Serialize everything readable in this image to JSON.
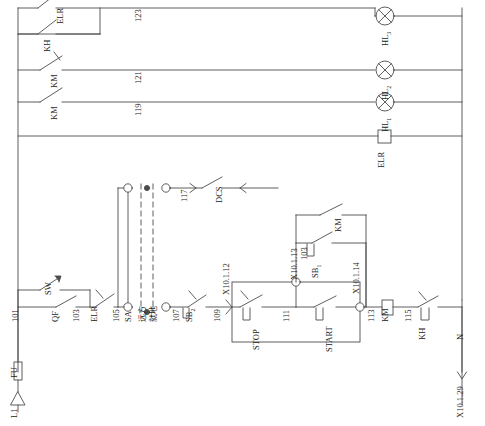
{
  "diagram": {
    "line_color": "#4d4d4d",
    "text_color": "#1a1a1a"
  },
  "supply": {
    "phase_label": "L1",
    "fuse_label": "FU",
    "wire_101": "101",
    "neutral_label": "N",
    "neutral_terminal": "X10.1.29"
  },
  "rungs": {
    "rail_123": "123",
    "rail_121": "121",
    "rail_119": "119",
    "rail_117": "117"
  },
  "lamps": [
    {
      "name": "HL",
      "sub": "3"
    },
    {
      "name": "HL",
      "sub": "2"
    },
    {
      "name": "HL",
      "sub": "1"
    }
  ],
  "devices": {
    "elr_contact_top": "ELR",
    "kh_contact_top": "KH",
    "km_nc_contact": "KM",
    "km_no_contact": "KM",
    "elr_relay": "ELR",
    "qf_contact": "QF",
    "sw_contact": "SW",
    "elr_contact_main": "ELR",
    "sa_switch": "SA",
    "sa_pos_remote": "远方",
    "sa_pos_local": "就地",
    "sb2_contact": "SB",
    "sb2_sub": "2",
    "sb1_contact": "SB",
    "sb1_sub": "1",
    "km_aux_contact": "KM",
    "stop_button": "STOP",
    "start_button": "START",
    "km_coil": "KM",
    "kh_contact_bottom": "KH",
    "dcs_contact": "DCS"
  },
  "wire_numbers": {
    "w101": "101",
    "w103": "103",
    "w105": "105",
    "w107": "107",
    "w109": "109",
    "w111": "111",
    "w113": "113",
    "w115": "115",
    "w103_seal": "103"
  },
  "terminals": {
    "t_x10112": "X10.1.12",
    "t_x10113": "X10.1.13",
    "t_x10114": "X10.1.14",
    "t_x10129": "X10.1.29"
  }
}
